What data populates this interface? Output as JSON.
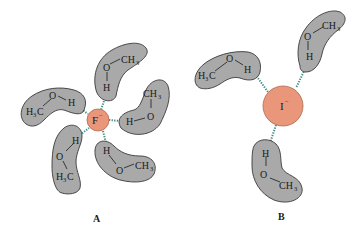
{
  "diagram": {
    "panels": [
      {
        "id": "A",
        "label": "A",
        "ion": {
          "symbol": "F",
          "charge": "−",
          "color": "#e9967a"
        },
        "molecules": [
          {
            "name": "methanol-top",
            "atoms": [
              "O",
              "H",
              "CH3"
            ]
          },
          {
            "name": "methanol-right",
            "atoms": [
              "H",
              "O",
              "CH3"
            ]
          },
          {
            "name": "methanol-left",
            "atoms": [
              "H3C",
              "O",
              "H"
            ]
          },
          {
            "name": "methanol-lower-left",
            "atoms": [
              "H",
              "O",
              "H3C"
            ]
          },
          {
            "name": "methanol-lower-right",
            "atoms": [
              "H",
              "O",
              "CH3"
            ]
          }
        ]
      },
      {
        "id": "B",
        "label": "B",
        "ion": {
          "symbol": "I",
          "charge": "−",
          "color": "#e9967a"
        },
        "molecules": [
          {
            "name": "methanol-left",
            "atoms": [
              "H3C",
              "O",
              "H"
            ]
          },
          {
            "name": "methanol-top-right",
            "atoms": [
              "H",
              "O",
              "CH3"
            ]
          },
          {
            "name": "methanol-bottom",
            "atoms": [
              "H",
              "O",
              "CH3"
            ]
          }
        ]
      }
    ],
    "text": {
      "O": "O",
      "H": "H",
      "C": "C",
      "CH": "CH",
      "three": "3",
      "minus": "−",
      "F": "F",
      "I": "I",
      "A": "A",
      "B": "B"
    },
    "colors": {
      "ion_fill": "#e9967a",
      "molecule_fill": "#a9a9a9",
      "hydrogen_bond": "#3f8f86"
    }
  }
}
